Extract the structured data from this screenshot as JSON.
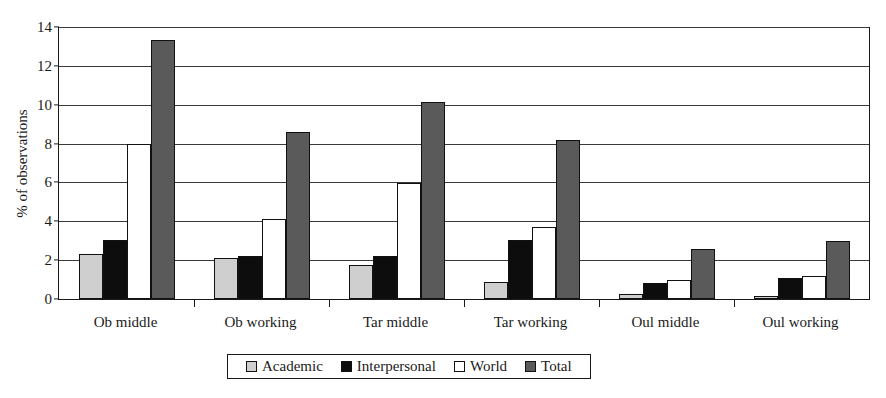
{
  "chart_data": {
    "type": "bar",
    "title": "",
    "xlabel": "",
    "ylabel": "% of observations",
    "ylim": [
      0,
      14
    ],
    "ytick_step": 2,
    "yticks": [
      0,
      2,
      4,
      6,
      8,
      10,
      12,
      14
    ],
    "grid": true,
    "legend_position": "bottom",
    "categories": [
      "Ob middle",
      "Ob working",
      "Tar middle",
      "Tar working",
      "Oul middle",
      "Oul working"
    ],
    "series": [
      {
        "name": "Academic",
        "color": "#cfcfcf",
        "values": [
          2.3,
          2.1,
          1.75,
          0.9,
          0.25,
          0.1
        ]
      },
      {
        "name": "Interpersonal",
        "color": "#0d0d0d",
        "values": [
          3.05,
          2.2,
          2.2,
          3.05,
          0.85,
          1.1
        ]
      },
      {
        "name": "World",
        "color": "#ffffff",
        "values": [
          8.0,
          4.1,
          5.95,
          3.7,
          1.0,
          1.2
        ]
      },
      {
        "name": "Total",
        "color": "#5a5a5a",
        "values": [
          13.35,
          8.6,
          10.15,
          8.2,
          2.55,
          3.0
        ]
      }
    ]
  }
}
